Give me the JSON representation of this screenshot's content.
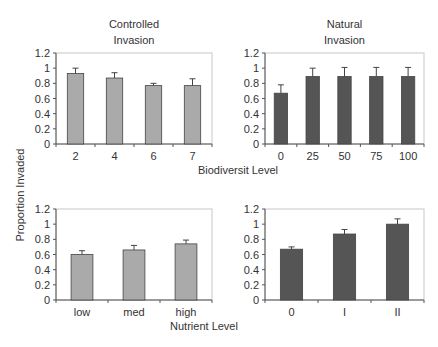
{
  "figure": {
    "ylabel": "Proportion Invaded",
    "xlabel_top": "Biodiversit Level",
    "xlabel_bottom": "Nutrient Level"
  },
  "colors": {
    "light_bar": "#aaaaaa",
    "dark_bar": "#555555",
    "axis": "#555555",
    "frame": "#c8c8c8"
  },
  "chart_data": [
    {
      "type": "bar",
      "title": "Controlled Invasion",
      "title_lines": [
        "Controlled",
        "Invasion"
      ],
      "xlabel": "Biodiversit Level",
      "ylabel": "Proportion Invaded",
      "categories": [
        "2",
        "4",
        "6",
        "7"
      ],
      "values": [
        0.93,
        0.87,
        0.77,
        0.77
      ],
      "errors": [
        0.07,
        0.07,
        0.03,
        0.09
      ],
      "ylim": [
        0,
        1.2
      ],
      "yticks": [
        "0",
        "0.2",
        "0.4",
        "0.6",
        "0.8",
        "1",
        "1.2"
      ],
      "bar_color": "#aaaaaa",
      "grid": false
    },
    {
      "type": "bar",
      "title": "Natural Invasion",
      "title_lines": [
        "Natural",
        "Invasion"
      ],
      "xlabel": "Biodiversit Level",
      "ylabel": "Proportion Invaded",
      "categories": [
        "0",
        "25",
        "50",
        "75",
        "100"
      ],
      "values": [
        0.67,
        0.89,
        0.89,
        0.89,
        0.89
      ],
      "errors": [
        0.11,
        0.11,
        0.12,
        0.12,
        0.12
      ],
      "ylim": [
        0,
        1.2
      ],
      "yticks": [
        "0",
        "0.2",
        "0.4",
        "0.6",
        "0.8",
        "1",
        "1.2"
      ],
      "bar_color": "#555555",
      "grid": false
    },
    {
      "type": "bar",
      "title": "",
      "xlabel": "Nutrient Level",
      "ylabel": "Proportion Invaded",
      "categories": [
        "low",
        "med",
        "high"
      ],
      "values": [
        0.6,
        0.66,
        0.74
      ],
      "errors": [
        0.05,
        0.06,
        0.05
      ],
      "ylim": [
        0,
        1.2
      ],
      "yticks": [
        "0",
        "0.2",
        "0.4",
        "0.6",
        "0.8",
        "1",
        "1.2"
      ],
      "bar_color": "#aaaaaa",
      "grid": false
    },
    {
      "type": "bar",
      "title": "",
      "xlabel": "Nutrient Level",
      "ylabel": "Proportion Invaded",
      "categories": [
        "0",
        "I",
        "II"
      ],
      "values": [
        0.67,
        0.87,
        1.0
      ],
      "errors": [
        0.03,
        0.06,
        0.07
      ],
      "ylim": [
        0,
        1.2
      ],
      "yticks": [
        "0",
        "0.2",
        "0.4",
        "0.6",
        "0.8",
        "1",
        "1.2"
      ],
      "bar_color": "#555555",
      "grid": false
    }
  ]
}
